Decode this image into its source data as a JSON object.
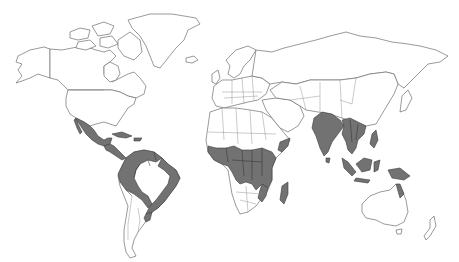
{
  "map": {
    "type": "world choropleth (binary)",
    "projection": "equirectangular-like",
    "background": "#ffffff",
    "colors": {
      "land_fill": "#ffffff",
      "outline": "#6e6e6e",
      "highlight_fill": "#727272"
    },
    "legend": null,
    "title": null,
    "highlighted_regions": [
      "Mexico",
      "Central America",
      "Caribbean (Cuba, Hispaniola)",
      "Colombia",
      "Venezuela",
      "Guyana",
      "Suriname",
      "French Guiana",
      "Ecuador",
      "Peru",
      "Bolivia",
      "Paraguay",
      "Brazil (coastal/north)",
      "Uruguay",
      "West Africa (Guinea coast)",
      "Central Africa",
      "DR Congo",
      "Angola",
      "Zambia",
      "East Africa",
      "Somalia (southern)",
      "Mozambique",
      "Madagascar",
      "India",
      "Bangladesh",
      "Myanmar",
      "Thailand",
      "Laos",
      "Cambodia",
      "Vietnam",
      "Philippines",
      "Malaysia",
      "Indonesia",
      "Papua New Guinea",
      "Northern Australia (Cape York)"
    ]
  }
}
